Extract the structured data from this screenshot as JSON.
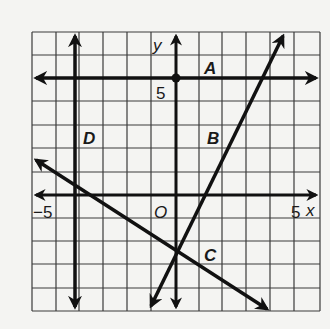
{
  "figure": {
    "grid": {
      "x_range": [
        -6,
        6
      ],
      "y_range": [
        -5,
        7
      ],
      "step": 1
    },
    "axes": {
      "x_label": "x",
      "y_label": "y",
      "origin_label": "O"
    },
    "ticks": {
      "x_neg": "−5",
      "x_pos": "5",
      "y_pos": "5"
    },
    "lines": [
      {
        "name": "A",
        "label": "A",
        "type": "horizontal",
        "equation": "y = 5"
      },
      {
        "name": "B",
        "label": "B",
        "type": "slanted",
        "slope": "positive"
      },
      {
        "name": "C",
        "label": "C",
        "type": "slanted",
        "slope": "negative"
      },
      {
        "name": "D",
        "label": "D",
        "type": "vertical",
        "equation": "x = -4"
      }
    ],
    "point": {
      "label": "(0, 5)"
    },
    "colors": {
      "grid": "#333333",
      "lines": "#111111",
      "background": "#f4f4f2"
    }
  }
}
